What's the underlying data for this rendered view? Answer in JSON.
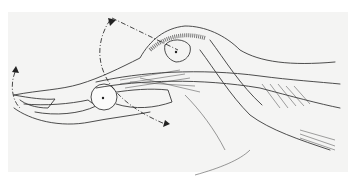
{
  "illustration": {
    "subject": "finger tendon anatomy line drawing",
    "colors": {
      "background": "#ffffff",
      "paper": "#f4f4f3",
      "ink": "#3a3a3a"
    }
  }
}
